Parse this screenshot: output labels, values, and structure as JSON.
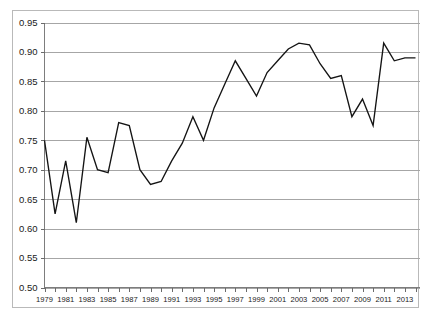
{
  "chart_data": {
    "type": "line",
    "title": "",
    "subtitle": "",
    "xlabel": "",
    "ylabel": "",
    "xlim": [
      1979,
      2014
    ],
    "ylim": [
      0.5,
      0.95
    ],
    "grid": true,
    "legend": false,
    "legend_position": "none",
    "line_color": "#141414",
    "grid_color": "#a6a6a6",
    "axis_color": "#7d7d7d",
    "y_ticks": [
      0.5,
      0.55,
      0.6,
      0.65,
      0.7,
      0.75,
      0.8,
      0.85,
      0.9,
      0.95
    ],
    "y_tick_labels": [
      "0.50",
      "0.55",
      "0.60",
      "0.65",
      "0.70",
      "0.75",
      "0.80",
      "0.85",
      "0.90",
      "0.95"
    ],
    "x_ticks": [
      1979,
      1980,
      1981,
      1982,
      1983,
      1984,
      1985,
      1986,
      1987,
      1988,
      1989,
      1990,
      1991,
      1992,
      1993,
      1994,
      1995,
      1996,
      1997,
      1998,
      1999,
      2000,
      2001,
      2002,
      2003,
      2004,
      2005,
      2006,
      2007,
      2008,
      2009,
      2010,
      2011,
      2012,
      2013,
      2014
    ],
    "x_tick_labels": [
      "1979",
      "",
      "1981",
      "",
      "1983",
      "",
      "1985",
      "",
      "1987",
      "",
      "1989",
      "",
      "1991",
      "",
      "1993",
      "",
      "1995",
      "",
      "1997",
      "",
      "1999",
      "",
      "2001",
      "",
      "2003",
      "",
      "2005",
      "",
      "2007",
      "",
      "2009",
      "",
      "2011",
      "",
      "2013",
      ""
    ],
    "x": [
      1979,
      1980,
      1981,
      1982,
      1983,
      1984,
      1985,
      1986,
      1987,
      1988,
      1989,
      1990,
      1991,
      1992,
      1993,
      1994,
      1995,
      1996,
      1997,
      1998,
      1999,
      2000,
      2001,
      2002,
      2003,
      2004,
      2005,
      2006,
      2007,
      2008,
      2009,
      2010,
      2011,
      2012,
      2013,
      2014
    ],
    "values": [
      0.75,
      0.625,
      0.715,
      0.61,
      0.755,
      0.7,
      0.695,
      0.78,
      0.775,
      0.7,
      0.675,
      0.68,
      0.715,
      0.745,
      0.79,
      0.75,
      0.805,
      0.845,
      0.885,
      0.855,
      0.825,
      0.865,
      0.885,
      0.905,
      0.915,
      0.912,
      0.88,
      0.855,
      0.86,
      0.79,
      0.82,
      0.775,
      0.915,
      0.885,
      0.89,
      0.89
    ]
  }
}
